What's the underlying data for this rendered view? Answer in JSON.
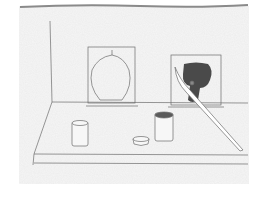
{
  "artwork": {
    "title": "Still-life sketch: painting easels, jars and brush",
    "medium": "pencil sketch on textured paper",
    "colors": {
      "background": "#ffffff",
      "paper": "#ececec",
      "paper_edge": "#8a8a8a",
      "line": "#6b6b6b",
      "paint": "#4a4a4a",
      "jar_paint": "#5a5a5a"
    },
    "elements": [
      {
        "name": "left-canvas",
        "content": "apple outline"
      },
      {
        "name": "right-canvas",
        "content": "dark paint blob"
      },
      {
        "name": "paintbrush",
        "content": "long brush leaning on right canvas"
      },
      {
        "name": "jar-left",
        "label": "crescent moon"
      },
      {
        "name": "jar-right",
        "label": "crescent moon"
      },
      {
        "name": "small-dish",
        "content": "shallow dish"
      }
    ]
  }
}
